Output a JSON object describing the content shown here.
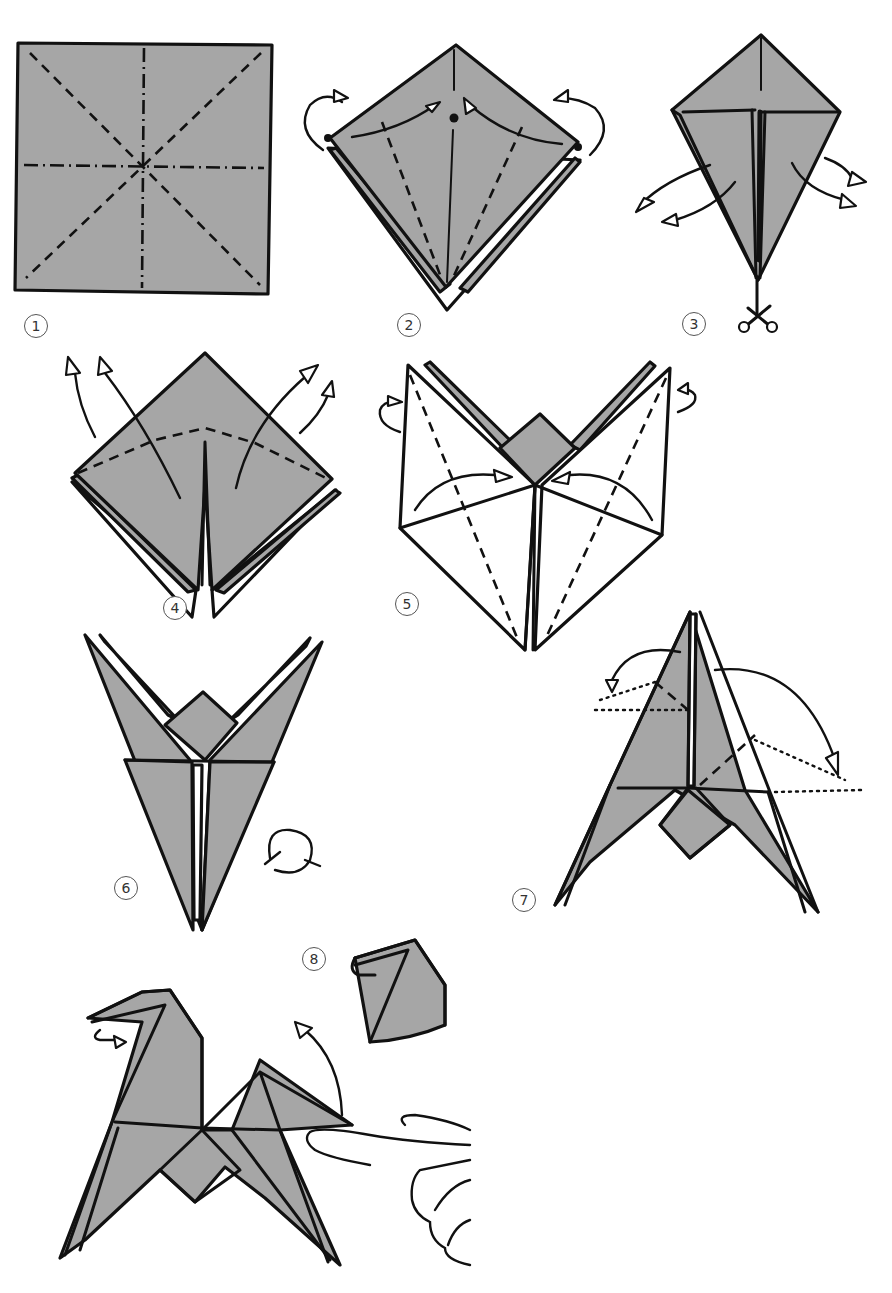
{
  "diagram": {
    "type": "origami-instructions",
    "paper_color": "#a6a6a6",
    "line_color": "#111111",
    "background": "#ffffff",
    "steps": [
      {
        "number": "1",
        "description": "Square sheet with diagonal valley folds and horizontal/vertical mountain folds"
      },
      {
        "number": "2",
        "description": "Square base; fold side corners to center line, repeat behind"
      },
      {
        "number": "3",
        "description": "Kite shape; unfold flaps"
      },
      {
        "number": "4",
        "description": "Fold top down along dashed line, lift bottom layers up"
      },
      {
        "number": "5",
        "description": "Petal fold; fold sides in, repeat behind"
      },
      {
        "number": "6",
        "description": "Bird base legs; turn model over"
      },
      {
        "number": "7",
        "description": "Inside-reverse fold head and tail along dotted lines"
      },
      {
        "number": "8",
        "description": "Finished horse; fold tail up, reverse fold head; detail view of head"
      }
    ],
    "legend": {
      "valley_fold": "dashed line",
      "mountain_fold": "dash-dot line",
      "reverse_fold_guide": "dotted line",
      "turn_over": "circular arrow"
    }
  }
}
